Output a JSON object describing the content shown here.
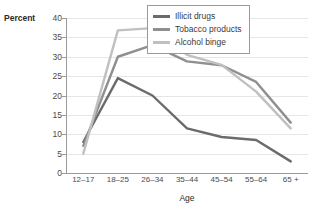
{
  "chart_data": {
    "type": "line",
    "title": "",
    "xlabel": "Age",
    "ylabel": "Percent",
    "categories": [
      "12–17",
      "18–25",
      "26–34",
      "35–44",
      "45–54",
      "55–64",
      "65 +"
    ],
    "ylim": [
      0,
      40
    ],
    "ytick_step": 5,
    "yticks": [
      "40",
      "35",
      "30",
      "25",
      "20",
      "15",
      "10",
      "5",
      "0"
    ],
    "grid": "horizontal",
    "legend_position": "top-right-inside",
    "series": [
      {
        "name": "Illicit drugs",
        "color": "#6b6b6b",
        "values": [
          8,
          24.5,
          20,
          11.5,
          9.3,
          8.5,
          3
        ]
      },
      {
        "name": "Tobacco products",
        "color": "#8f8f8f",
        "values": [
          7,
          30,
          33,
          28.8,
          27.8,
          23.5,
          13
        ]
      },
      {
        "name": "Alcohol binge",
        "color": "#c0c0c0",
        "values": [
          5,
          36.8,
          37.4,
          30.5,
          27.9,
          21,
          11.5
        ]
      }
    ]
  }
}
